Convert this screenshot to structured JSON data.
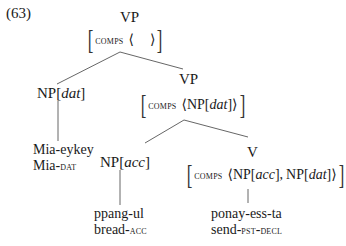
{
  "example_number": "(63)",
  "tree": {
    "root": {
      "label": "VP",
      "feature": {
        "attr": "comps",
        "open": "⟨",
        "value": "",
        "close": "⟩"
      }
    },
    "np_dat": {
      "cat": "NP[",
      "case": "dat",
      "close": "]",
      "word": "Mia-eykey",
      "gloss_stem": "Mia-",
      "gloss_tag": "dat"
    },
    "vp2": {
      "label": "VP",
      "feature": {
        "attr": "comps",
        "open": "⟨",
        "value_cat": "NP[",
        "value_case": "dat",
        "value_close": "]",
        "close": "⟩"
      }
    },
    "np_acc": {
      "cat": "NP[",
      "case": "acc",
      "close": "]",
      "word": "ppang-ul",
      "gloss_stem": "bread-",
      "gloss_tag": "acc"
    },
    "v": {
      "label": "V",
      "feature": {
        "attr": "comps",
        "open": "⟨",
        "item1_cat": "NP[",
        "item1_case": "acc",
        "item1_close": "],",
        "item2_cat": "NP[",
        "item2_case": "dat",
        "item2_close": "]",
        "close": "⟩"
      },
      "word": "ponay-ess-ta",
      "gloss_stem": "send-",
      "gloss_tag1": "pst",
      "gloss_sep": "-",
      "gloss_tag2": "decl"
    }
  }
}
